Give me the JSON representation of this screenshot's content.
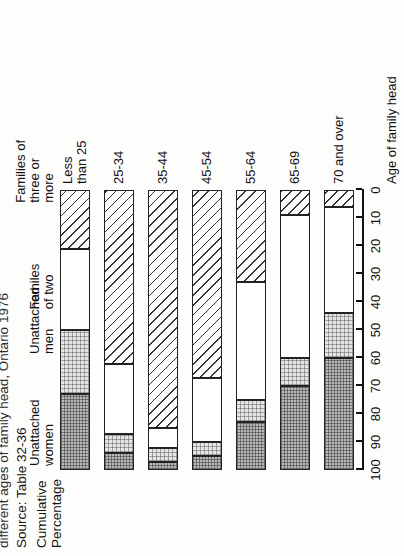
{
  "figure": {
    "title_line": "different ages of family head, Ontario 1976",
    "source": "Source: Table 32-36",
    "yaxis_title_line1": "Cumulative",
    "yaxis_title_line2": "Percentage",
    "xaxis_title": "Age of family head"
  },
  "axis": {
    "ticks": [
      "100",
      "90",
      "80",
      "70",
      "60",
      "50",
      "40",
      "30",
      "20",
      "10",
      "0"
    ],
    "min": 0,
    "max": 100
  },
  "legend": [
    {
      "key": "women",
      "line1": "Unattached",
      "line2": "women"
    },
    {
      "key": "men",
      "line1": "Unattached",
      "line2": "men"
    },
    {
      "key": "fam2",
      "line1": "Familes",
      "line2": "of two"
    },
    {
      "key": "fam3",
      "line1": "Families of",
      "line2": "three or",
      "line3": "more"
    }
  ],
  "chart_data": {
    "type": "bar",
    "title": "different ages of family head, Ontario 1976",
    "subtitle": "Source: Table 32-36",
    "xlabel": "Age of family head",
    "ylabel": "Cumulative Percentage",
    "ylim": [
      0,
      100
    ],
    "grid": false,
    "stacked": true,
    "orientation": "vertical-cumulative",
    "legend_position": "in-plot-top-bar",
    "categories": [
      "Less\nthan 25",
      "25-34",
      "35-44",
      "45-54",
      "55-64",
      "65-69",
      "70 and over"
    ],
    "category_labels_flat": [
      "Less than 25",
      "25-34",
      "35-44",
      "45-54",
      "55-64",
      "65-69",
      "70 and over"
    ],
    "series": [
      {
        "name": "Unattached women",
        "values": [
          27,
          6,
          3,
          5,
          17,
          30,
          40
        ]
      },
      {
        "name": "Unattached men",
        "values": [
          23,
          7,
          5,
          5,
          8,
          10,
          16
        ]
      },
      {
        "name": "Familes of two",
        "values": [
          29,
          25,
          7,
          23,
          42,
          51,
          38
        ]
      },
      {
        "name": "Families of three or more",
        "values": [
          21,
          62,
          85,
          67,
          33,
          9,
          6
        ]
      }
    ],
    "cumulative_boundaries": {
      "note": "cumulative percentage at the lower edge of each segment, top-down",
      "Less than 25": [
        73,
        50,
        21,
        0
      ],
      "25-34": [
        94,
        87,
        62,
        0
      ],
      "35-44": [
        97,
        92,
        85,
        0
      ],
      "45-54": [
        95,
        90,
        67,
        0
      ],
      "55-64": [
        83,
        75,
        33,
        0
      ],
      "65-69": [
        70,
        60,
        9,
        0
      ],
      "70 and over": [
        60,
        44,
        6,
        0
      ]
    }
  }
}
